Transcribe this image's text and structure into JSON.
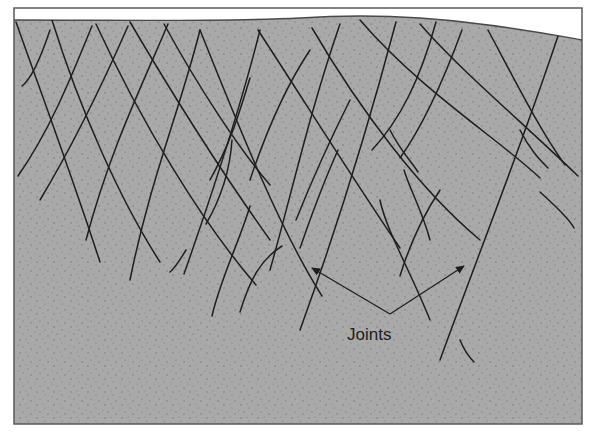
{
  "diagram": {
    "colors": {
      "rock": "#a8a8a8",
      "sky": "#ffffff",
      "frame": "#5a5a5a",
      "joint_line": "#1f1f1f",
      "stipple": "#6e6e6e"
    },
    "annotation": {
      "label": "Joints",
      "arrows": [
        {
          "from": [
            390,
            314
          ],
          "to": [
            312,
            268
          ]
        },
        {
          "from": [
            390,
            314
          ],
          "to": [
            464,
            266
          ]
        }
      ]
    },
    "frame": {
      "x": 14,
      "y": 8,
      "width": 568,
      "height": 416
    },
    "ground_surface": "M14,20 C120,20 220,22 300,18 C360,14 420,16 480,24 C530,30 560,36 582,40",
    "joints": [
      "M16,22 C40,90 70,170 100,262",
      "M52,20 C80,110 120,200 160,262",
      "M96,24 C140,120 200,220 256,285",
      "M130,22 C170,90 220,170 270,240",
      "M164,24 C200,90 240,150 270,185",
      "M200,30 C240,130 280,230 322,296",
      "M258,30 C310,110 360,190 400,248",
      "M312,28 C360,110 420,190 480,240",
      "M360,20 C420,90 500,140 540,178",
      "M420,24 C460,70 520,120 578,176",
      "M488,30 C520,90 540,130 565,165",
      "M50,30 C40,60 30,80 22,86",
      "M92,26 C70,80 50,130 18,176",
      "M128,26 C100,90 70,150 40,200",
      "M168,24 C140,90 110,150 86,240",
      "M200,30 C180,110 150,180 130,280",
      "M260,30 C240,110 210,200 184,274",
      "M340,24 C310,110 290,200 270,270",
      "M396,22 C370,120 340,220 300,330",
      "M436,22 C420,80 400,120 372,150",
      "M462,30 C440,90 420,130 400,158",
      "M558,36 C520,150 480,250 440,360",
      "M250,78 C240,110 232,140 210,180",
      "M232,140 C230,170 220,200 206,224",
      "M310,50 C290,80 270,120 250,180",
      "M350,100 C330,140 316,170 296,220",
      "M338,150 C320,190 310,220 300,248",
      "M250,206 C240,240 220,280 212,316",
      "M282,246 C260,260 250,280 240,312",
      "M390,130 C400,150 410,160 418,172",
      "M404,170 C410,190 422,210 430,240",
      "M440,190 C420,220 408,250 400,276",
      "M540,192 C560,210 570,220 574,228",
      "M520,130 C530,150 540,160 548,168",
      "M186,250 C180,260 175,268 170,272",
      "M380,200 C386,230 410,270 430,320",
      "M460,340 C464,350 468,356 474,362"
    ]
  }
}
